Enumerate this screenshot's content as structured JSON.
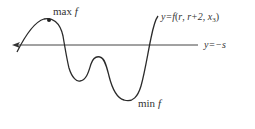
{
  "diagram": {
    "type": "function-graph",
    "curve": {
      "label_prefix": "y=f",
      "args": [
        "r",
        "r+2",
        "x"
      ],
      "x_subscript": "3",
      "open": "(",
      "close": ")",
      "sep1": ",  ",
      "sep2": ",  "
    },
    "horizontal_line": {
      "label": "y=−s",
      "direction": "left-arrow"
    },
    "max_label": {
      "text": "max",
      "var": "f"
    },
    "min_label": {
      "text": "min",
      "var": "f"
    },
    "colors": {
      "curve": "#2b2b2b",
      "axis": "#444444",
      "text": "#333333",
      "background": "#ffffff"
    }
  }
}
